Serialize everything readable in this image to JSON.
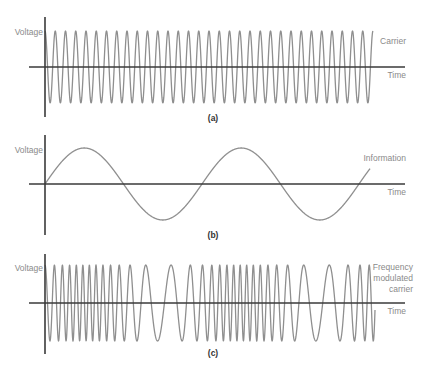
{
  "figure": {
    "panels": [
      {
        "id": "a",
        "caption": "(a)",
        "y_label": "Voltage",
        "x_label": "Time",
        "signal_label": [
          "Carrier"
        ],
        "signal": "carrier",
        "axis": {
          "x0": 45,
          "y_top": 17,
          "y_bottom": 117,
          "h_axis_y": 67,
          "h_start": 29,
          "h_end": 405
        },
        "wave": {
          "x_start": 45,
          "x_end": 373,
          "amplitude": 36,
          "period": 10.25
        }
      },
      {
        "id": "b",
        "caption": "(b)",
        "y_label": "Voltage",
        "x_label": "Time",
        "signal_label": [
          "Information"
        ],
        "signal": "information",
        "axis": {
          "x0": 45,
          "y_top": 135,
          "y_bottom": 235,
          "h_axis_y": 184,
          "h_start": 29,
          "h_end": 405
        },
        "wave": {
          "x_start": 45,
          "x_end": 370,
          "amplitude": 36,
          "period": 157
        }
      },
      {
        "id": "c",
        "caption": "(c)",
        "y_label": "Voltage",
        "x_label": "Time",
        "signal_label": [
          "Frequency",
          "modulated",
          "carrier"
        ],
        "signal": "frequency_modulated_carrier",
        "axis": {
          "x0": 45,
          "y_top": 254,
          "y_bottom": 354,
          "h_axis_y": 303,
          "h_start": 29,
          "h_end": 405
        },
        "wave": {
          "x_start": 45,
          "x_end": 375,
          "amplitude": 38,
          "period_mean": 10.5,
          "deviation": 0.62,
          "info_period": 157
        }
      }
    ],
    "colors": {
      "axis": "#3a3a3a",
      "wave": "#8f8f8f",
      "label": "#8a8a8a",
      "caption": "#333333"
    }
  }
}
